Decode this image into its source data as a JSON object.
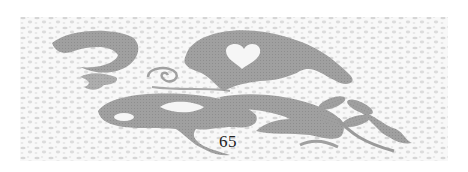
{
  "page": {
    "page_number": "65",
    "illustration": {
      "subject": "decorative butterfly ornament on mottled stone texture",
      "fill_color": "#9a9a9a",
      "background_color": "#f7f7f7",
      "texture_color": "#d9d9d9"
    }
  }
}
